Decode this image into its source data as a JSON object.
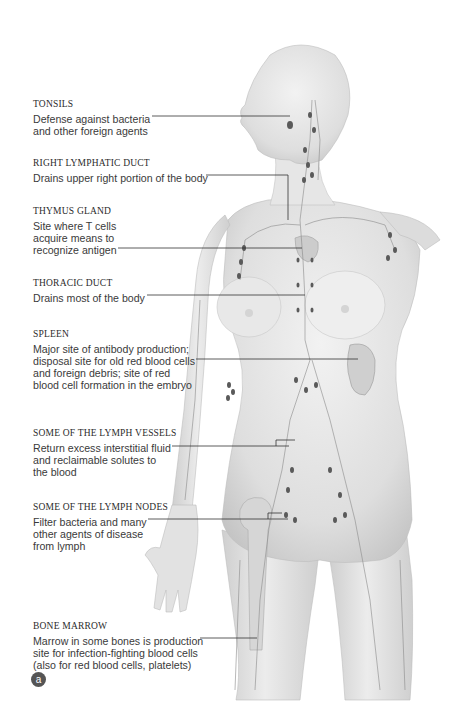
{
  "figure": {
    "panel_label": "a",
    "colors": {
      "background": "#ffffff",
      "skin": "#e4e4e4",
      "skin_shadow": "#c8c8c8",
      "node": "#555555",
      "leader_line": "#333333",
      "heading_text": "#2b2b2b",
      "body_text": "#3a3a3a"
    },
    "labels": [
      {
        "heading": "TONSILS",
        "description": "Defense against bacteria\nand other foreign agents"
      },
      {
        "heading": "RIGHT LYMPHATIC DUCT",
        "description": "Drains upper right portion of the body"
      },
      {
        "heading": "THYMUS GLAND",
        "description": "Site where T cells\nacquire means to\nrecognize antigen"
      },
      {
        "heading": "THORACIC DUCT",
        "description": "Drains most of the body"
      },
      {
        "heading": "SPLEEN",
        "description": "Major site of antibody production;\ndisposal site for old red blood cells\nand foreign debris; site of red\nblood cell formation in the embryo"
      },
      {
        "heading": "SOME OF THE LYMPH VESSELS",
        "description": "Return excess interstitial fluid\nand reclaimable solutes to\nthe blood"
      },
      {
        "heading": "SOME OF THE LYMPH NODES",
        "description": "Filter bacteria and many\nother agents of disease\nfrom lymph"
      },
      {
        "heading": "BONE MARROW",
        "description": "Marrow in some bones is production\nsite for infection-fighting blood cells\n(also for red blood cells, platelets)"
      }
    ]
  }
}
